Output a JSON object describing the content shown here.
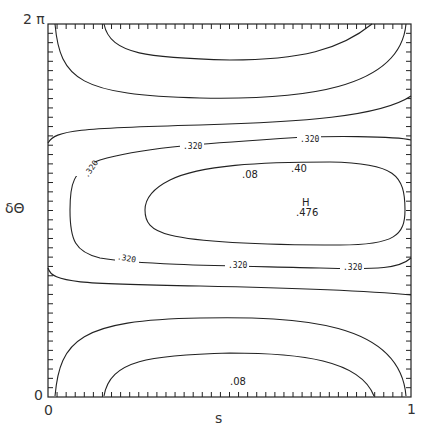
{
  "chart_data": {
    "type": "contour",
    "title": "",
    "xlabel": "s",
    "ylabel": "δΘ",
    "xlim": [
      0,
      1
    ],
    "ylim": [
      0,
      "2π"
    ],
    "x_ticks": [
      "0",
      "1"
    ],
    "y_ticks": [
      "0",
      "2 π"
    ],
    "contour_levels": [
      0.08,
      0.32,
      0.4
    ],
    "contour_labels": [
      ".08",
      ".320",
      ".320",
      ".320",
      ".320",
      ".320",
      ".320",
      ".40",
      ".08"
    ],
    "maximum": {
      "marker": "H",
      "value": ".476",
      "s": 0.7,
      "dtheta": "π"
    },
    "grid": false
  },
  "axes": {
    "y_top": "2 π",
    "y_bottom": "0",
    "x_left": "0",
    "x_right": "1",
    "xlabel": "s",
    "ylabel": "δΘ"
  },
  "labels": {
    "top_08": ".08",
    "bottom_08": ".08",
    "c320": ".320",
    "c40": ".40",
    "H": "H",
    "hval": ".476"
  }
}
